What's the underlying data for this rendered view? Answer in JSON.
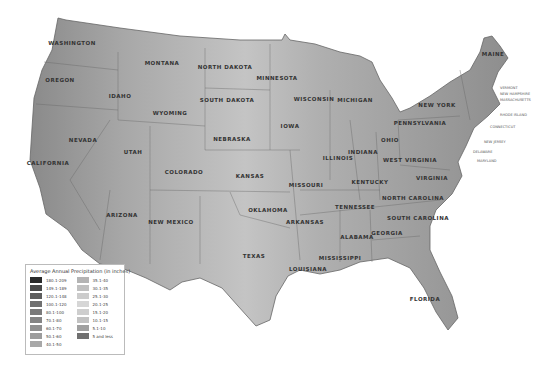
{
  "map": {
    "title": "Average Annual Precipitation (in inches)",
    "states": [
      {
        "name": "WASHINGTON",
        "x": 72,
        "y": 43
      },
      {
        "name": "OREGON",
        "x": 60,
        "y": 80
      },
      {
        "name": "IDAHO",
        "x": 120,
        "y": 96
      },
      {
        "name": "MONTANA",
        "x": 162,
        "y": 63
      },
      {
        "name": "WYOMING",
        "x": 170,
        "y": 113
      },
      {
        "name": "NORTH DAKOTA",
        "x": 225,
        "y": 67
      },
      {
        "name": "SOUTH DAKOTA",
        "x": 227,
        "y": 100
      },
      {
        "name": "MINNESOTA",
        "x": 277,
        "y": 78
      },
      {
        "name": "WISCONSIN",
        "x": 314,
        "y": 99
      },
      {
        "name": "MICHIGAN",
        "x": 355,
        "y": 100
      },
      {
        "name": "IOWA",
        "x": 290,
        "y": 126
      },
      {
        "name": "NEBRASKA",
        "x": 232,
        "y": 139
      },
      {
        "name": "NEVADA",
        "x": 83,
        "y": 140
      },
      {
        "name": "UTAH",
        "x": 133,
        "y": 152
      },
      {
        "name": "COLORADO",
        "x": 184,
        "y": 172
      },
      {
        "name": "KANSAS",
        "x": 250,
        "y": 176
      },
      {
        "name": "CALIFORNIA",
        "x": 48,
        "y": 163
      },
      {
        "name": "ARIZONA",
        "x": 122,
        "y": 215
      },
      {
        "name": "NEW MEXICO",
        "x": 171,
        "y": 222
      },
      {
        "name": "OKLAHOMA",
        "x": 268,
        "y": 210
      },
      {
        "name": "TEXAS",
        "x": 254,
        "y": 256
      },
      {
        "name": "MISSOURI",
        "x": 306,
        "y": 185
      },
      {
        "name": "ARKANSAS",
        "x": 305,
        "y": 222
      },
      {
        "name": "LOUISIANA",
        "x": 308,
        "y": 269
      },
      {
        "name": "MISSISSIPPI",
        "x": 340,
        "y": 258
      },
      {
        "name": "ILLINOIS",
        "x": 338,
        "y": 158
      },
      {
        "name": "INDIANA",
        "x": 363,
        "y": 152
      },
      {
        "name": "OHIO",
        "x": 390,
        "y": 140
      },
      {
        "name": "KENTUCKY",
        "x": 370,
        "y": 182
      },
      {
        "name": "TENNESSEE",
        "x": 355,
        "y": 207
      },
      {
        "name": "ALABAMA",
        "x": 357,
        "y": 237
      },
      {
        "name": "GEORGIA",
        "x": 387,
        "y": 233
      },
      {
        "name": "FLORIDA",
        "x": 425,
        "y": 299
      },
      {
        "name": "SOUTH CAROLINA",
        "x": 418,
        "y": 218
      },
      {
        "name": "NORTH CAROLINA",
        "x": 413,
        "y": 198
      },
      {
        "name": "VIRGINIA",
        "x": 432,
        "y": 178
      },
      {
        "name": "WEST VIRGINIA",
        "x": 410,
        "y": 160
      },
      {
        "name": "PENNSYLVANIA",
        "x": 420,
        "y": 123
      },
      {
        "name": "NEW YORK",
        "x": 437,
        "y": 105
      },
      {
        "name": "MAINE",
        "x": 493,
        "y": 54
      }
    ],
    "small_labels": [
      {
        "name": "VERMONT",
        "x": 500,
        "y": 86
      },
      {
        "name": "NEW HAMPSHIRE",
        "x": 500,
        "y": 92
      },
      {
        "name": "MASSACHUSETTS",
        "x": 500,
        "y": 98
      },
      {
        "name": "RHODE ISLAND",
        "x": 500,
        "y": 113
      },
      {
        "name": "CONNECTICUT",
        "x": 490,
        "y": 125
      },
      {
        "name": "NEW JERSEY",
        "x": 484,
        "y": 140
      },
      {
        "name": "DELAWARE",
        "x": 473,
        "y": 150
      },
      {
        "name": "MARYLAND",
        "x": 477,
        "y": 159
      }
    ]
  },
  "legend": {
    "title": "Average Annual Precipitation (in inches)",
    "left": [
      {
        "label": "180.1-209",
        "color": "#2a2a2a"
      },
      {
        "label": "149.1-189",
        "color": "#4a4a4a"
      },
      {
        "label": "120.1-148",
        "color": "#5e5e5e"
      },
      {
        "label": "100.1-120",
        "color": "#707070"
      },
      {
        "label": "80.1-100",
        "color": "#7a7a7a"
      },
      {
        "label": "70.1-80",
        "color": "#848484"
      },
      {
        "label": "60.1-70",
        "color": "#909090"
      },
      {
        "label": "50.1-60",
        "color": "#9c9c9c"
      },
      {
        "label": "40.1-50",
        "color": "#a8a8a8"
      }
    ],
    "right": [
      {
        "label": "35.1-40",
        "color": "#b4b4b4"
      },
      {
        "label": "30.1-35",
        "color": "#c0c0c0"
      },
      {
        "label": "25.1-30",
        "color": "#cccccc"
      },
      {
        "label": "20.1-25",
        "color": "#d6d6d6"
      },
      {
        "label": "15.1-20",
        "color": "#cecece"
      },
      {
        "label": "10.1-15",
        "color": "#c2c2c2"
      },
      {
        "label": "5.1-10",
        "color": "#a0a0a0"
      },
      {
        "label": "5 and less",
        "color": "#707070"
      }
    ]
  }
}
